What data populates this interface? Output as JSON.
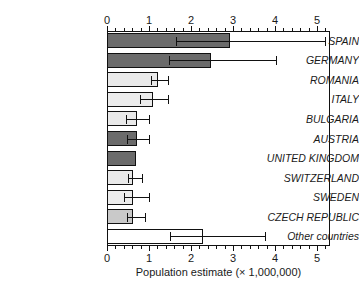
{
  "chart_data": {
    "type": "bar",
    "orientation": "horizontal",
    "title": "",
    "xlabel": "Population estimate (× 1,000,000)",
    "ylabel": "",
    "xlim": [
      0,
      5.31
    ],
    "grid": false,
    "legend": null,
    "axis_top": true,
    "axis_bottom": true,
    "xticks": [
      0,
      1,
      2,
      3,
      4,
      5
    ],
    "xtick_labels": [
      "0",
      "1",
      "2",
      "3",
      "4",
      "5"
    ],
    "minor_ticks_per_interval": 4,
    "categories": [
      "SPAIN",
      "GERMANY",
      "ROMANIA",
      "ITALY",
      "BULGARIA",
      "AUSTRIA",
      "UNITED KINGDOM",
      "SWITZERLAND",
      "SWEDEN",
      "CZECH REPUBLIC",
      "Other countries"
    ],
    "values": [
      2.93,
      2.48,
      1.22,
      1.1,
      0.72,
      0.72,
      0.7,
      0.62,
      0.62,
      0.62,
      2.28
    ],
    "error_low": [
      1.65,
      1.48,
      1.05,
      0.78,
      0.45,
      0.48,
      null,
      0.5,
      0.4,
      0.48,
      1.5
    ],
    "error_high": [
      5.19,
      4.02,
      1.45,
      1.45,
      1.0,
      1.0,
      null,
      0.83,
      1.0,
      0.9,
      3.75
    ],
    "bar_colors": [
      "#6b6b6b",
      "#6b6b6b",
      "#e9e9e9",
      "#ececec",
      "#e9e9e9",
      "#6b6b6b",
      "#6b6b6b",
      "#e9e9e9",
      "#ececec",
      "#c9c9c9",
      "#ffffff"
    ],
    "bar_edge_color": "#111111",
    "error_color": "#111111"
  }
}
